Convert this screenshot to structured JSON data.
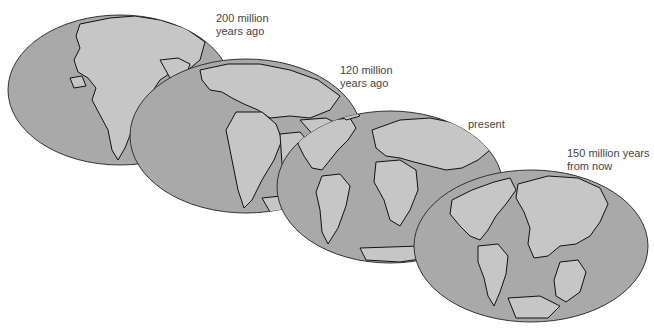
{
  "figure": {
    "colors": {
      "ocean": "#a9a9a9",
      "land": "#c6c6c6",
      "outline": "#111111",
      "text": "#444444"
    },
    "maps": [
      {
        "id": "200mya",
        "label_line1": "200 million",
        "label_line2": "years ago"
      },
      {
        "id": "120mya",
        "label_line1": "120 million",
        "label_line2": "years ago"
      },
      {
        "id": "present",
        "label_line1": "present",
        "label_line2": ""
      },
      {
        "id": "150my_future",
        "label_line1": "150 million years",
        "label_line2": "from now"
      }
    ]
  }
}
